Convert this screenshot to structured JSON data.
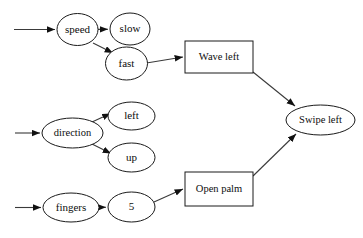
{
  "diagram": {
    "background_color": "#ffffff",
    "stroke_color": "#1a1a1a",
    "edge_color": "#3a3a3a",
    "nodes": [
      {
        "id": "speed",
        "label": "speed",
        "shape": "ellipse",
        "cx": 77.5,
        "cy": 29.5,
        "rx": 20.5,
        "ry": 16
      },
      {
        "id": "slow",
        "label": "slow",
        "shape": "ellipse",
        "cx": 130,
        "cy": 29,
        "rx": 20,
        "ry": 16
      },
      {
        "id": "fast",
        "label": "fast",
        "shape": "ellipse",
        "cx": 126.5,
        "cy": 63.5,
        "rx": 21,
        "ry": 16.5
      },
      {
        "id": "direction",
        "label": "direction",
        "shape": "ellipse",
        "cx": 72.5,
        "cy": 133,
        "rx": 30.5,
        "ry": 15
      },
      {
        "id": "left",
        "label": "left",
        "shape": "ellipse",
        "cx": 131.5,
        "cy": 116,
        "rx": 23.5,
        "ry": 14
      },
      {
        "id": "up",
        "label": "up",
        "shape": "ellipse",
        "cx": 131.5,
        "cy": 157.5,
        "rx": 23.5,
        "ry": 14.5
      },
      {
        "id": "fingers",
        "label": "fingers",
        "shape": "ellipse",
        "cx": 71,
        "cy": 207.5,
        "rx": 28,
        "ry": 14.5
      },
      {
        "id": "five",
        "label": "5",
        "shape": "ellipse",
        "cx": 131.5,
        "cy": 207,
        "rx": 23.5,
        "ry": 15
      },
      {
        "id": "wave-left",
        "label": "Wave left",
        "shape": "rectangle",
        "x": 185,
        "y": 41,
        "w": 68,
        "h": 32
      },
      {
        "id": "open-palm",
        "label": "Open palm",
        "shape": "rectangle",
        "x": 185,
        "y": 172,
        "w": 68,
        "h": 34
      },
      {
        "id": "swipe-left",
        "label": "Swipe left",
        "shape": "ellipse",
        "cx": 320.5,
        "cy": 120,
        "rx": 34.5,
        "ry": 15
      }
    ],
    "edges": [
      {
        "id": "entry-speed",
        "from": "",
        "to": "speed",
        "points": "14,29.5 55,29.5",
        "arrow": true
      },
      {
        "id": "speed-to-slow",
        "from": "speed",
        "to": "slow",
        "points": "98,29.4 108,29.2",
        "arrow": true
      },
      {
        "id": "speed-to-fast",
        "from": "speed",
        "to": "fast",
        "points": "93,43 113,53",
        "arrow": true
      },
      {
        "id": "fast-to-wave-left",
        "from": "fast",
        "to": "wave-left",
        "points": "146.5,63 183,57",
        "arrow": true
      },
      {
        "id": "entry-direction",
        "from": "",
        "to": "direction",
        "points": "15,133 40,133",
        "arrow": true
      },
      {
        "id": "direction-to-left",
        "from": "direction",
        "to": "left",
        "points": "92,122 110.5,113.5",
        "arrow": true
      },
      {
        "id": "direction-to-up",
        "from": "direction",
        "to": "up",
        "points": "92,144 111,153.5",
        "arrow": true
      },
      {
        "id": "entry-fingers",
        "from": "",
        "to": "fingers",
        "points": "15,207.5 41,207.5",
        "arrow": true
      },
      {
        "id": "fingers-to-five",
        "from": "fingers",
        "to": "five",
        "points": "99,207.3 106,207.2",
        "arrow": true
      },
      {
        "id": "five-to-open-palm",
        "from": "five",
        "to": "open-palm",
        "points": "154,202 183,189",
        "arrow": true
      },
      {
        "id": "wave-left-to-swipe-left",
        "from": "wave-left",
        "to": "swipe-left",
        "points": "253,72 295,106",
        "arrow": true
      },
      {
        "id": "open-palm-to-swipe-left",
        "from": "open-palm",
        "to": "swipe-left",
        "points": "253,176 296,134",
        "arrow": true
      }
    ]
  }
}
